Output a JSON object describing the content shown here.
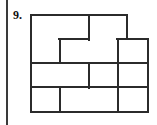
{
  "page": {
    "width": 157,
    "height": 125,
    "background_color": "#ffffff",
    "margin_rule_color": "#3a3a3a"
  },
  "problem": {
    "number_label": "9.",
    "text_color": "#111111"
  },
  "figure": {
    "name": "interlocking-zigzag-tessellation",
    "stroke_color": "#2b2b2b",
    "fill_color": "#ffffff",
    "stroke_width": 2,
    "origin_x": 31,
    "origin_y": 15,
    "cell_width": 29,
    "cell_height": 24,
    "columns": 4,
    "rows": 4,
    "tile_count": 8,
    "tiles": [
      {
        "id": "tile-1",
        "row": 1,
        "col": 1,
        "points": "31,15 89,15 89,39 60,39 60,63 31,63"
      },
      {
        "id": "tile-2",
        "row": 1,
        "col": 2,
        "points": "89,15 127,15 127,39 118,39 118,63 60,63 60,39 89,39"
      },
      {
        "id": "tile-3",
        "row": 1,
        "col": 3,
        "points": "127,39 148,39 148,63 118,63 118,39"
      },
      {
        "id": "tile-4",
        "row": 2,
        "col": 1,
        "points": "31,63 89,63 89,87 60,87 60,112 31,112"
      },
      {
        "id": "tile-5",
        "row": 2,
        "col": 2,
        "points": "89,63 118,63 118,87 89,87"
      },
      {
        "id": "tile-6",
        "row": 2,
        "col": 3,
        "points": "118,63 148,63 148,87 118,87"
      },
      {
        "id": "tile-7",
        "row": 2,
        "col": 4,
        "points": "60,87 118,87 118,112 60,112"
      },
      {
        "id": "tile-8",
        "row": 2,
        "col": 5,
        "points": "118,87 148,87 148,112 118,112"
      }
    ],
    "outline": "31,15 89,15 89,15 127,15 127,39 148,39 148,112 118,112 60,112 31,112",
    "segments": [
      {
        "name": "outer-top-left",
        "x1": 31,
        "y1": 15,
        "x2": 127,
        "y2": 15
      },
      {
        "name": "outer-left",
        "x1": 31,
        "y1": 15,
        "x2": 31,
        "y2": 112
      },
      {
        "name": "outer-bottom",
        "x1": 60,
        "y1": 112,
        "x2": 148,
        "y2": 112
      },
      {
        "name": "outer-right",
        "x1": 148,
        "y1": 39,
        "x2": 148,
        "y2": 112
      },
      {
        "name": "step-top-right-v",
        "x1": 127,
        "y1": 15,
        "x2": 127,
        "y2": 39
      },
      {
        "name": "step-top-right-h",
        "x1": 127,
        "y1": 39,
        "x2": 148,
        "y2": 39
      },
      {
        "name": "step-bottom-left-v",
        "x1": 60,
        "y1": 87,
        "x2": 60,
        "y2": 112
      },
      {
        "name": "step-bottom-left-h",
        "x1": 31,
        "y1": 87,
        "x2": 60,
        "y2": 87
      },
      {
        "name": "divider-r1-a-h",
        "x1": 60,
        "y1": 39,
        "x2": 89,
        "y2": 39
      },
      {
        "name": "divider-r1-a-v",
        "x1": 60,
        "y1": 39,
        "x2": 60,
        "y2": 63
      },
      {
        "name": "divider-r1-b-v",
        "x1": 89,
        "y1": 15,
        "x2": 89,
        "y2": 39
      },
      {
        "name": "divider-r1-c-h",
        "x1": 118,
        "y1": 39,
        "x2": 127,
        "y2": 39
      },
      {
        "name": "divider-r1-c-v",
        "x1": 118,
        "y1": 39,
        "x2": 118,
        "y2": 63
      },
      {
        "name": "mid-horizontal",
        "x1": 31,
        "y1": 63,
        "x2": 148,
        "y2": 63
      },
      {
        "name": "divider-r2-a-h",
        "x1": 60,
        "y1": 87,
        "x2": 89,
        "y2": 87
      },
      {
        "name": "divider-r2-a-v",
        "x1": 89,
        "y1": 63,
        "x2": 89,
        "y2": 87
      },
      {
        "name": "divider-r2-b-h",
        "x1": 89,
        "y1": 87,
        "x2": 118,
        "y2": 87
      },
      {
        "name": "divider-r2-b-v",
        "x1": 118,
        "y1": 87,
        "x2": 118,
        "y2": 112
      }
    ]
  }
}
